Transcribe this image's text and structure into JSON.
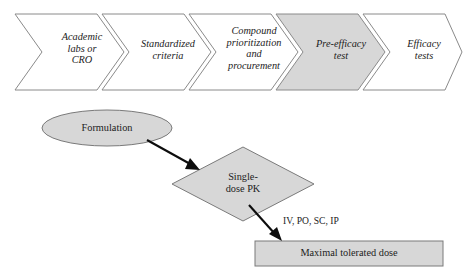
{
  "figure": {
    "background_color": "#ffffff",
    "outline_color": "#8a8a8a",
    "shaded_fill": "#d7d7d7",
    "plain_fill": "#ffffff",
    "arrow_color": "#0d0d0d"
  },
  "process_chevrons": {
    "name": "drug-development-process-flow",
    "steps": [
      {
        "id": "academic-labs-or-cro",
        "lines": [
          "Academic",
          "labs or",
          "CRO"
        ],
        "highlighted": false
      },
      {
        "id": "standardized-criteria",
        "lines": [
          "Standardized",
          "criteria"
        ],
        "highlighted": false
      },
      {
        "id": "compound-prioritization-and-procurement",
        "lines": [
          "Compound",
          "prioritization",
          "and",
          "procurement"
        ],
        "highlighted": false
      },
      {
        "id": "pre-efficacy-test",
        "lines": [
          "Pre-efficacy",
          "test"
        ],
        "highlighted": true
      },
      {
        "id": "efficacy-tests",
        "lines": [
          "Efficacy",
          "tests"
        ],
        "highlighted": false
      }
    ]
  },
  "flowchart": {
    "name": "pre-efficacy-test-detail",
    "nodes": [
      {
        "id": "formulation",
        "shape": "ellipse",
        "lines": [
          "Formulation"
        ]
      },
      {
        "id": "single-dose-pk",
        "shape": "diamond",
        "lines": [
          "Single-",
          "dose PK"
        ]
      },
      {
        "id": "maximal-tolerated-dose",
        "shape": "rectangle",
        "lines": [
          "Maximal tolerated dose"
        ]
      }
    ],
    "edge_labels": [
      {
        "id": "routes-of-administration",
        "text": "IV, PO, SC, IP"
      }
    ],
    "connectors": [
      {
        "id": "formulation-to-single-dose-pk",
        "from": "formulation",
        "to": "single-dose-pk"
      },
      {
        "id": "single-dose-pk-to-maximal-tolerated-dose",
        "from": "single-dose-pk",
        "to": "maximal-tolerated-dose"
      }
    ]
  }
}
